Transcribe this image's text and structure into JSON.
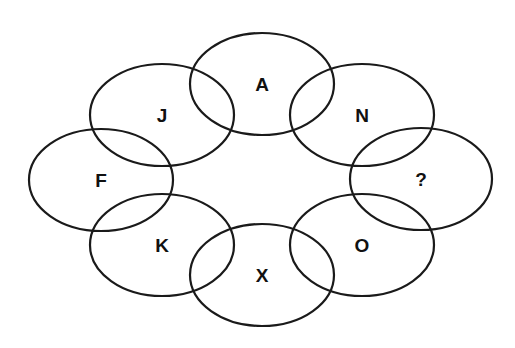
{
  "puzzle": {
    "type": "letter-sequence-ring",
    "circles": [
      {
        "id": "top",
        "label": "A",
        "cx": 262,
        "cy": 84,
        "rx": 72,
        "ry": 51
      },
      {
        "id": "top-right",
        "label": "N",
        "cx": 362,
        "cy": 115,
        "rx": 72,
        "ry": 51
      },
      {
        "id": "right",
        "label": "?",
        "cx": 421,
        "cy": 179,
        "rx": 71,
        "ry": 51
      },
      {
        "id": "bottom-right",
        "label": "O",
        "cx": 362,
        "cy": 245,
        "rx": 72,
        "ry": 51
      },
      {
        "id": "bottom",
        "label": "X",
        "cx": 262,
        "cy": 275,
        "rx": 72,
        "ry": 51
      },
      {
        "id": "bottom-left",
        "label": "K",
        "cx": 162,
        "cy": 245,
        "rx": 72,
        "ry": 51
      },
      {
        "id": "left",
        "label": "F",
        "cx": 101,
        "cy": 180,
        "rx": 72,
        "ry": 51
      },
      {
        "id": "top-left",
        "label": "J",
        "cx": 162,
        "cy": 115,
        "rx": 72,
        "ry": 51
      }
    ],
    "stroke_color": "#1a1a1a",
    "background": "#ffffff"
  }
}
